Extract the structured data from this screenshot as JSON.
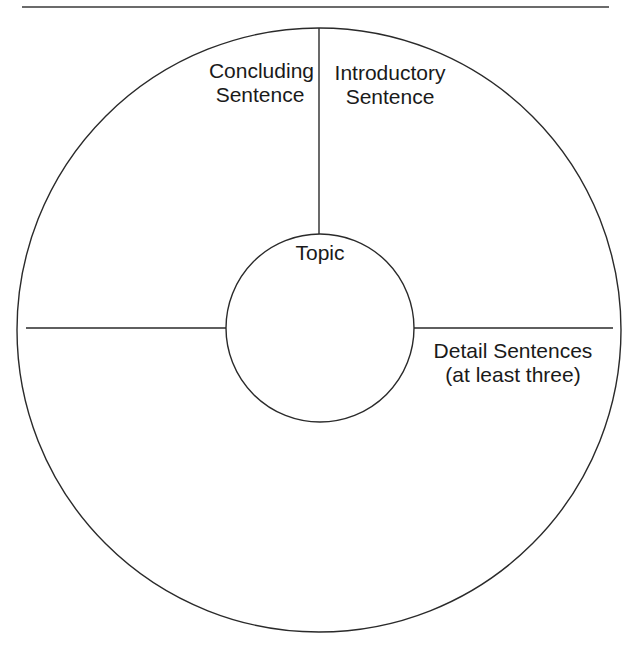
{
  "diagram": {
    "center_label": "Topic",
    "sections": [
      {
        "id": "concluding",
        "lines": [
          "Concluding",
          "Sentence"
        ]
      },
      {
        "id": "introductory",
        "lines": [
          "Introductory",
          "Sentence"
        ]
      },
      {
        "id": "detail",
        "lines": [
          "Detail Sentences",
          "(at least three)"
        ]
      },
      {
        "id": "blank",
        "lines": []
      }
    ],
    "colors": {
      "line": "#2a2a2a",
      "text": "#1a1a1a",
      "background": "#ffffff"
    }
  }
}
